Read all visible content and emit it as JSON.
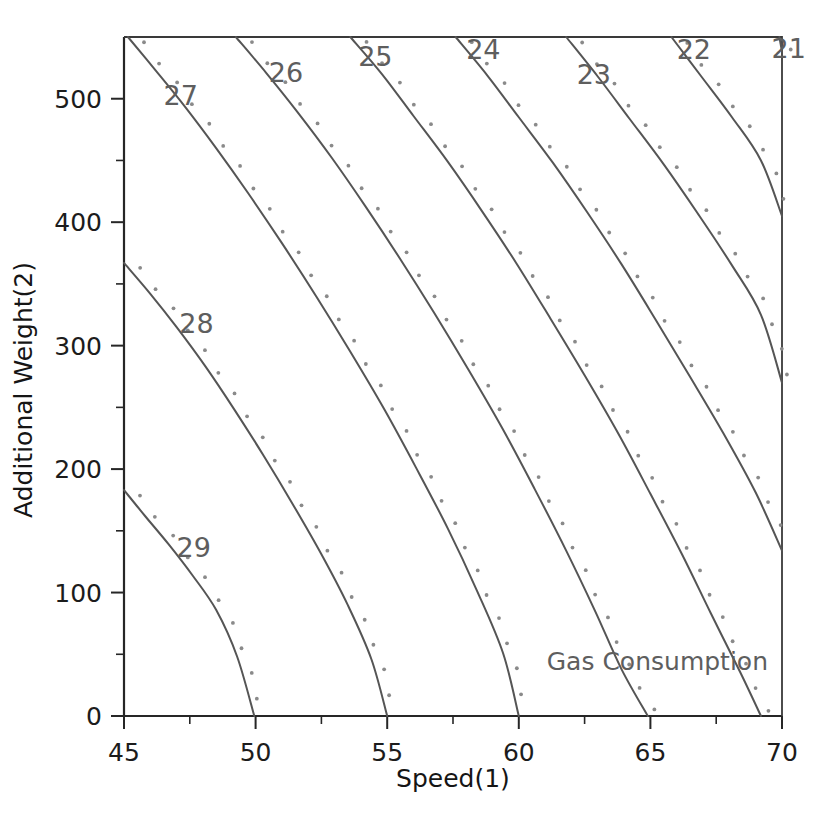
{
  "chart_data": {
    "type": "line",
    "subtype": "contour",
    "title": "",
    "annotation": "Gas Consumption",
    "xlabel": "Speed(1)",
    "ylabel": "Additional Weight(2)",
    "xlim": [
      45,
      70
    ],
    "ylim": [
      0,
      550
    ],
    "xticks": [
      45,
      50,
      55,
      60,
      65,
      70
    ],
    "xticklabels": [
      "45",
      "50",
      "55",
      "60",
      "65",
      "70"
    ],
    "xminor_step": 2.5,
    "yticks": [
      0,
      100,
      200,
      300,
      400,
      500
    ],
    "yticklabels": [
      "0",
      "100",
      "200",
      "300",
      "400",
      "500"
    ],
    "yminor_step": 50,
    "grid": false,
    "legend": false,
    "contour_levels": [
      21,
      22,
      23,
      24,
      25,
      26,
      27,
      28,
      29
    ],
    "contour_label_color": "#5e5e5e",
    "contour_line_color": "#555555",
    "marker_dot_color": "#8a8a8a",
    "contours": [
      {
        "level": 29,
        "label": "29",
        "label_x": 47.0,
        "label_y": 137,
        "points": [
          [
            45.0,
            183
          ],
          [
            45.8,
            162
          ],
          [
            46.7,
            139
          ],
          [
            47.6,
            114
          ],
          [
            48.5,
            86
          ],
          [
            49.3,
            48
          ],
          [
            49.95,
            0
          ]
        ]
      },
      {
        "level": 28,
        "label": "28",
        "label_x": 47.1,
        "label_y": 318,
        "points": [
          [
            45.0,
            367
          ],
          [
            46.0,
            342
          ],
          [
            47.0,
            315
          ],
          [
            48.1,
            283
          ],
          [
            49.2,
            248
          ],
          [
            50.3,
            211
          ],
          [
            51.4,
            172
          ],
          [
            52.5,
            131
          ],
          [
            53.5,
            90
          ],
          [
            54.4,
            46
          ],
          [
            55.0,
            0
          ]
        ]
      },
      {
        "level": 27,
        "label": "27",
        "label_x": 46.5,
        "label_y": 503,
        "points": [
          [
            45.15,
            550
          ],
          [
            46.2,
            523
          ],
          [
            47.3,
            494
          ],
          [
            48.5,
            460
          ],
          [
            49.7,
            424
          ],
          [
            51.0,
            383
          ],
          [
            52.3,
            340
          ],
          [
            53.6,
            295
          ],
          [
            54.9,
            248
          ],
          [
            56.1,
            201
          ],
          [
            57.3,
            152
          ],
          [
            58.4,
            102
          ],
          [
            59.4,
            51
          ],
          [
            60.0,
            0
          ]
        ]
      },
      {
        "level": 26,
        "label": "26",
        "label_x": 50.5,
        "label_y": 522,
        "points": [
          [
            49.25,
            550
          ],
          [
            50.4,
            521
          ],
          [
            51.6,
            489
          ],
          [
            52.9,
            452
          ],
          [
            54.2,
            412
          ],
          [
            55.5,
            370
          ],
          [
            56.8,
            326
          ],
          [
            58.1,
            280
          ],
          [
            59.4,
            232
          ],
          [
            60.6,
            184
          ],
          [
            61.8,
            134
          ],
          [
            62.9,
            85
          ],
          [
            63.9,
            38
          ],
          [
            64.9,
            0
          ]
        ]
      },
      {
        "level": 25,
        "label": "25",
        "label_x": 53.9,
        "label_y": 535,
        "points": [
          [
            53.6,
            550
          ],
          [
            54.8,
            520
          ],
          [
            56.0,
            486
          ],
          [
            57.3,
            449
          ],
          [
            58.6,
            409
          ],
          [
            59.9,
            367
          ],
          [
            61.2,
            322
          ],
          [
            62.5,
            276
          ],
          [
            63.8,
            228
          ],
          [
            65.0,
            180
          ],
          [
            66.2,
            131
          ],
          [
            67.3,
            83
          ],
          [
            68.4,
            36
          ],
          [
            69.2,
            0
          ]
        ]
      },
      {
        "level": 24,
        "label": "24",
        "label_x": 58.0,
        "label_y": 540,
        "points": [
          [
            57.6,
            550
          ],
          [
            58.8,
            519
          ],
          [
            60.0,
            485
          ],
          [
            61.3,
            448
          ],
          [
            62.6,
            408
          ],
          [
            63.9,
            366
          ],
          [
            65.2,
            321
          ],
          [
            66.5,
            275
          ],
          [
            67.8,
            228
          ],
          [
            69.0,
            181
          ],
          [
            70.0,
            134
          ]
        ]
      },
      {
        "level": 23,
        "label": "23",
        "label_x": 62.2,
        "label_y": 520,
        "points": [
          [
            61.8,
            550
          ],
          [
            63.0,
            518
          ],
          [
            64.2,
            484
          ],
          [
            65.5,
            447
          ],
          [
            66.8,
            407
          ],
          [
            68.1,
            365
          ],
          [
            69.2,
            325
          ],
          [
            70.0,
            270
          ]
        ]
      },
      {
        "level": 22,
        "label": "22",
        "label_x": 66.0,
        "label_y": 540,
        "points": [
          [
            65.8,
            550
          ],
          [
            66.9,
            519
          ],
          [
            68.1,
            485
          ],
          [
            69.2,
            450
          ],
          [
            70.0,
            405
          ]
        ]
      },
      {
        "level": 21,
        "label": "21",
        "label_x": 69.6,
        "label_y": 541,
        "points": [
          [
            69.9,
            550
          ],
          [
            70.0,
            538
          ]
        ]
      }
    ]
  }
}
